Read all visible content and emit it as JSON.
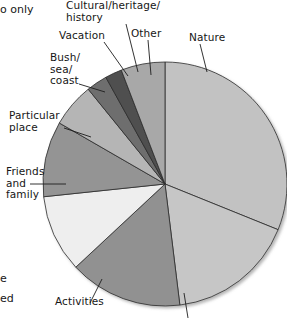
{
  "figure": {
    "background": "#ffffff",
    "cropped_text_fragments": [
      {
        "name": "top-left-fragment",
        "text": "o only",
        "x": 0,
        "y": 3
      },
      {
        "name": "bottom-left-fragment-1",
        "text": "e",
        "x": 0,
        "y": 272
      },
      {
        "name": "bottom-left-fragment-2",
        "text": "ed",
        "x": 0,
        "y": 292
      }
    ]
  },
  "chart_data": {
    "type": "pie",
    "title": "",
    "xlabel": "",
    "ylabel": "",
    "legend": "none",
    "grid": false,
    "note": "Grayscale pie chart; slice labels placed outside with leader lines. One slice at the bottom is cut off by the image crop and its label is not visible.",
    "categories": [
      "Nature",
      "Unlabelled (cropped)",
      "Activities",
      "Friends and family",
      "Particular place",
      "Bush/sea/coast",
      "Vacation",
      "Cultural/heritage/history",
      "Other"
    ],
    "values": [
      31,
      17,
      15,
      10,
      10,
      6,
      3,
      2,
      6
    ],
    "colors": [
      "#c2c2c2",
      "#c6c6c6",
      "#919191",
      "#eeeeee",
      "#949494",
      "#b5b5b5",
      "#6e6e6e",
      "#4f4f4f",
      "#a8a8a8"
    ],
    "start_angle_deg": 0,
    "direction": "clockwise",
    "slices": [
      {
        "label": "Nature",
        "value": 31,
        "color": "#c2c2c2",
        "start_deg": 0,
        "end_deg": 112
      },
      {
        "label": "Unlabelled (cropped)",
        "value": 17,
        "color": "#c6c6c6",
        "start_deg": 112,
        "end_deg": 173
      },
      {
        "label": "Activities",
        "value": 15,
        "color": "#919191",
        "start_deg": 173,
        "end_deg": 227
      },
      {
        "label": "Friends and family",
        "value": 10,
        "color": "#eeeeee",
        "start_deg": 227,
        "end_deg": 264
      },
      {
        "label": "Particular place",
        "value": 10,
        "color": "#949494",
        "start_deg": 264,
        "end_deg": 300
      },
      {
        "label": "Bush/sea/coast",
        "value": 6,
        "color": "#b5b5b5",
        "start_deg": 300,
        "end_deg": 321
      },
      {
        "label": "Vacation",
        "value": 3,
        "color": "#6e6e6e",
        "start_deg": 321,
        "end_deg": 331
      },
      {
        "label": "Cultural/heritage/history",
        "value": 2,
        "color": "#4f4f4f",
        "start_deg": 331,
        "end_deg": 339
      },
      {
        "label": "Other",
        "value": 6,
        "color": "#a8a8a8",
        "start_deg": 339,
        "end_deg": 360
      }
    ]
  },
  "labels": {
    "nature": "Nature",
    "other": "Other",
    "cultural": "Cultural/heritage/\nhistory",
    "vacation": "Vacation",
    "bush": "Bush/\nsea/\ncoast",
    "particular_place": "Particular\nplace",
    "friends": "Friends\nand\nfamily",
    "activities": "Activities"
  }
}
